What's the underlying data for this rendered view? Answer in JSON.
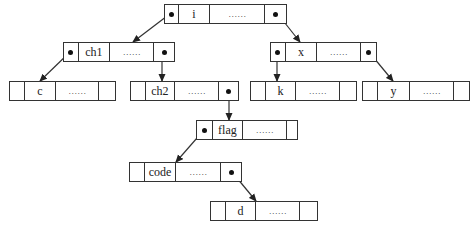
{
  "diagram": {
    "type": "binary-tree-node-structure",
    "nodes": [
      {
        "id": "i",
        "label": "i",
        "data": "……",
        "left_ptr": true,
        "right_ptr": true,
        "x": 164,
        "y": 4,
        "cells": [
          14,
          32,
          56,
          21
        ]
      },
      {
        "id": "ch1",
        "label": "ch1",
        "data": "……",
        "left_ptr": true,
        "right_ptr": true,
        "x": 63,
        "y": 42,
        "cells": [
          15,
          32,
          45,
          20
        ]
      },
      {
        "id": "x",
        "label": "x",
        "data": "……",
        "left_ptr": true,
        "right_ptr": true,
        "x": 270,
        "y": 42,
        "cells": [
          15,
          32,
          45,
          15
        ]
      },
      {
        "id": "c",
        "label": "c",
        "data": "……",
        "left_ptr": false,
        "right_ptr": false,
        "x": 9,
        "y": 81,
        "cells": [
          15,
          32,
          44,
          16
        ]
      },
      {
        "id": "ch2",
        "label": "ch2",
        "data": "……",
        "left_ptr": false,
        "right_ptr": true,
        "x": 130,
        "y": 81,
        "cells": [
          15,
          30,
          45,
          19
        ]
      },
      {
        "id": "k",
        "label": "k",
        "data": "……",
        "left_ptr": false,
        "right_ptr": false,
        "x": 250,
        "y": 81,
        "cells": [
          15,
          31,
          45,
          16
        ]
      },
      {
        "id": "y",
        "label": "y",
        "data": "……",
        "left_ptr": false,
        "right_ptr": false,
        "x": 362,
        "y": 81,
        "cells": [
          15,
          33,
          45,
          15
        ]
      },
      {
        "id": "flag",
        "label": "flag",
        "data": "……",
        "left_ptr": true,
        "right_ptr": false,
        "x": 196,
        "y": 120,
        "cells": [
          16,
          31,
          45,
          10
        ]
      },
      {
        "id": "code",
        "label": "code",
        "data": "……",
        "left_ptr": false,
        "right_ptr": true,
        "x": 129,
        "y": 162,
        "cells": [
          15,
          32,
          46,
          20
        ]
      },
      {
        "id": "d",
        "label": "d",
        "data": "……",
        "left_ptr": false,
        "right_ptr": false,
        "x": 210,
        "y": 201,
        "cells": [
          15,
          31,
          45,
          17
        ]
      }
    ],
    "edges": [
      {
        "from": "i",
        "side": "left",
        "to": "ch1",
        "x1": 171,
        "y1": 13,
        "x2": 133,
        "y2": 42
      },
      {
        "from": "i",
        "side": "right",
        "to": "x",
        "x1": 277,
        "y1": 13,
        "x2": 300,
        "y2": 42
      },
      {
        "from": "ch1",
        "side": "left",
        "to": "c",
        "x1": 70,
        "y1": 52,
        "x2": 40,
        "y2": 81
      },
      {
        "from": "ch1",
        "side": "right",
        "to": "ch2",
        "x1": 162,
        "y1": 52,
        "x2": 162,
        "y2": 81
      },
      {
        "from": "x",
        "side": "left",
        "to": "k",
        "x1": 277,
        "y1": 52,
        "x2": 277,
        "y2": 81
      },
      {
        "from": "x",
        "side": "right",
        "to": "y",
        "x1": 369,
        "y1": 52,
        "x2": 393,
        "y2": 81
      },
      {
        "from": "ch2",
        "side": "right",
        "to": "flag",
        "x1": 229,
        "y1": 91,
        "x2": 229,
        "y2": 120
      },
      {
        "from": "flag",
        "side": "left",
        "to": "code",
        "x1": 204,
        "y1": 130,
        "x2": 176,
        "y2": 162
      },
      {
        "from": "code",
        "side": "right",
        "to": "d",
        "x1": 232,
        "y1": 172,
        "x2": 256,
        "y2": 201
      }
    ],
    "colors": {
      "line": "#333333",
      "pointer": "#111111",
      "background": "#ffffff"
    }
  }
}
